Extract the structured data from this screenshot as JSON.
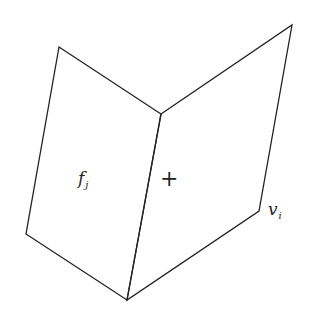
{
  "diagram": {
    "type": "folded-faces",
    "colors": {
      "stroke": "#222222",
      "background": "#ffffff"
    },
    "faces": [
      {
        "name": "left-face",
        "vertices": [
          [
            59,
            47
          ],
          [
            161,
            114
          ],
          [
            127,
            300
          ],
          [
            26,
            234
          ]
        ]
      },
      {
        "name": "right-face",
        "vertices": [
          [
            161,
            114
          ],
          [
            292,
            25
          ],
          [
            259,
            211
          ],
          [
            127,
            300
          ]
        ]
      }
    ],
    "labels": {
      "face": {
        "main": "f",
        "sub": "j"
      },
      "plus": "+",
      "vertex": {
        "main": "v",
        "sub": "i"
      }
    }
  }
}
